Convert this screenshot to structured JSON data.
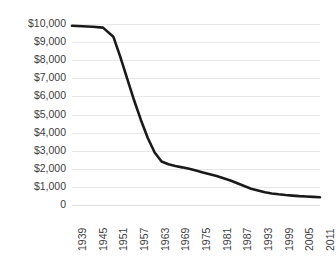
{
  "chart_data": {
    "type": "line",
    "title": "",
    "subtitle": "",
    "xlabel": "",
    "ylabel": "",
    "grid": true,
    "legend": "none",
    "xlim": [
      1939,
      2011
    ],
    "ylim": [
      0,
      10000
    ],
    "y_ticks": [
      {
        "value": 10000,
        "label": "$10,000"
      },
      {
        "value": 9000,
        "label": "$9,000"
      },
      {
        "value": 8000,
        "label": "$8,000"
      },
      {
        "value": 7000,
        "label": "$7,000"
      },
      {
        "value": 6000,
        "label": "$6,000"
      },
      {
        "value": 5000,
        "label": "$5,000"
      },
      {
        "value": 4000,
        "label": "$4,000"
      },
      {
        "value": 3000,
        "label": "$3,000"
      },
      {
        "value": 2000,
        "label": "$2,000"
      },
      {
        "value": 1000,
        "label": "$1,000"
      },
      {
        "value": 0,
        "label": "0"
      }
    ],
    "x_ticks": [
      {
        "value": 1939,
        "label": "1939"
      },
      {
        "value": 1945,
        "label": "1945"
      },
      {
        "value": 1951,
        "label": "1951"
      },
      {
        "value": 1957,
        "label": "1957"
      },
      {
        "value": 1963,
        "label": "1963"
      },
      {
        "value": 1969,
        "label": "1969"
      },
      {
        "value": 1975,
        "label": "1975"
      },
      {
        "value": 1981,
        "label": "1981"
      },
      {
        "value": 1987,
        "label": "1987"
      },
      {
        "value": 1993,
        "label": "1993"
      },
      {
        "value": 1999,
        "label": "1999"
      },
      {
        "value": 2005,
        "label": "2005"
      },
      {
        "value": 2011,
        "label": "2011"
      }
    ],
    "series": [
      {
        "name": "value",
        "color": "#1a1a1a",
        "x": [
          1939,
          1945,
          1948,
          1951,
          1953,
          1955,
          1957,
          1959,
          1961,
          1963,
          1965,
          1967,
          1969,
          1971,
          1973,
          1975,
          1977,
          1979,
          1981,
          1983,
          1985,
          1987,
          1989,
          1991,
          1993,
          1995,
          1997,
          1999,
          2001,
          2003,
          2005,
          2007,
          2009,
          2011
        ],
        "values": [
          9900,
          9850,
          9800,
          9300,
          8200,
          7000,
          5800,
          4700,
          3700,
          2900,
          2400,
          2250,
          2150,
          2080,
          2000,
          1900,
          1800,
          1700,
          1600,
          1480,
          1350,
          1200,
          1050,
          900,
          800,
          700,
          640,
          590,
          550,
          520,
          490,
          470,
          450,
          430
        ]
      }
    ]
  }
}
